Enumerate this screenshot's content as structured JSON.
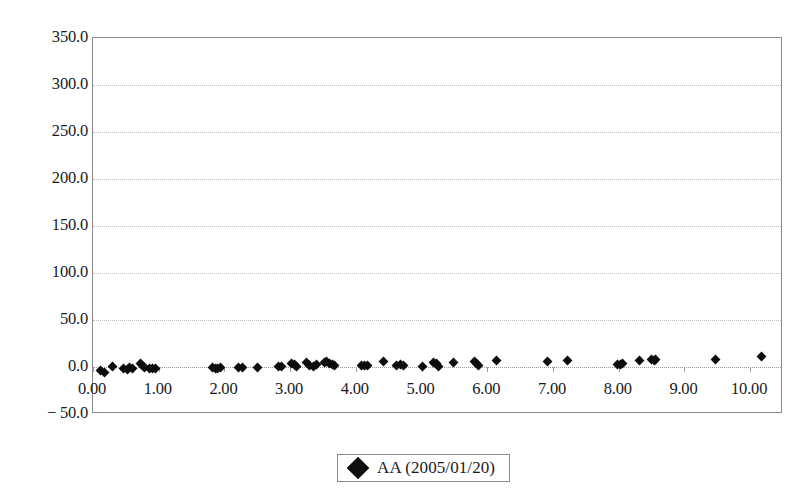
{
  "chart_data": {
    "type": "scatter",
    "title": "",
    "xlabel": "",
    "ylabel": "",
    "xlim": [
      0.0,
      10.5
    ],
    "ylim": [
      -50.0,
      350.0
    ],
    "grid": true,
    "legend_position": "bottom-center",
    "y_ticks": [
      350.0,
      300.0,
      250.0,
      200.0,
      150.0,
      100.0,
      50.0,
      0.0,
      -50.0
    ],
    "y_tick_labels": [
      "350.0",
      "300.0",
      "250.0",
      "200.0",
      "150.0",
      "100.0",
      "50.0",
      "0.0",
      "− 50.0"
    ],
    "x_ticks": [
      0.0,
      1.0,
      2.0,
      3.0,
      4.0,
      5.0,
      6.0,
      7.0,
      8.0,
      9.0,
      10.0
    ],
    "x_tick_labels": [
      "0.00",
      "1.00",
      "2.00",
      "3.00",
      "4.00",
      "5.00",
      "6.00",
      "7.00",
      "8.00",
      "9.00",
      "10.00"
    ],
    "series": [
      {
        "name": "AA (2005/01/20)",
        "marker": "filled-diamond",
        "color": "#0d0d0d",
        "points": [
          [
            0.12,
            -4.0
          ],
          [
            0.17,
            -6.0
          ],
          [
            0.3,
            0.5
          ],
          [
            0.47,
            -1.5
          ],
          [
            0.52,
            -2.5
          ],
          [
            0.56,
            -1.0
          ],
          [
            0.6,
            -2.0
          ],
          [
            0.72,
            4.0
          ],
          [
            0.75,
            2.0
          ],
          [
            0.78,
            -1.0
          ],
          [
            0.86,
            -1.5
          ],
          [
            0.9,
            -2.0
          ],
          [
            0.95,
            -1.5
          ],
          [
            1.82,
            -1.0
          ],
          [
            1.86,
            -2.0
          ],
          [
            1.9,
            -1.5
          ],
          [
            1.94,
            -1.0
          ],
          [
            2.22,
            -1.0
          ],
          [
            2.27,
            -1.0
          ],
          [
            2.5,
            0.0
          ],
          [
            2.82,
            0.5
          ],
          [
            2.87,
            1.0
          ],
          [
            3.02,
            3.5
          ],
          [
            3.06,
            2.5
          ],
          [
            3.1,
            0.5
          ],
          [
            3.25,
            4.5
          ],
          [
            3.3,
            2.0
          ],
          [
            3.36,
            0.5
          ],
          [
            3.4,
            2.5
          ],
          [
            3.52,
            4.5
          ],
          [
            3.56,
            5.5
          ],
          [
            3.6,
            4.0
          ],
          [
            3.64,
            2.5
          ],
          [
            3.68,
            1.5
          ],
          [
            4.08,
            1.5
          ],
          [
            4.13,
            2.0
          ],
          [
            4.18,
            1.5
          ],
          [
            4.42,
            5.5
          ],
          [
            4.62,
            2.0
          ],
          [
            4.68,
            2.5
          ],
          [
            4.73,
            2.0
          ],
          [
            5.02,
            1.0
          ],
          [
            5.18,
            5.0
          ],
          [
            5.22,
            3.5
          ],
          [
            5.26,
            1.0
          ],
          [
            5.48,
            4.5
          ],
          [
            5.8,
            6.0
          ],
          [
            5.84,
            4.0
          ],
          [
            5.86,
            1.5
          ],
          [
            6.14,
            7.0
          ],
          [
            6.92,
            5.5
          ],
          [
            7.22,
            6.5
          ],
          [
            7.98,
            3.0
          ],
          [
            8.02,
            2.5
          ],
          [
            8.06,
            4.0
          ],
          [
            8.32,
            6.5
          ],
          [
            8.5,
            8.5
          ],
          [
            8.54,
            6.5
          ],
          [
            8.56,
            8.0
          ],
          [
            9.48,
            7.5
          ],
          [
            10.18,
            11.0
          ]
        ]
      }
    ]
  },
  "legend": {
    "entries": [
      {
        "label": "AA (2005/01/20)",
        "marker": "filled-diamond"
      }
    ]
  }
}
